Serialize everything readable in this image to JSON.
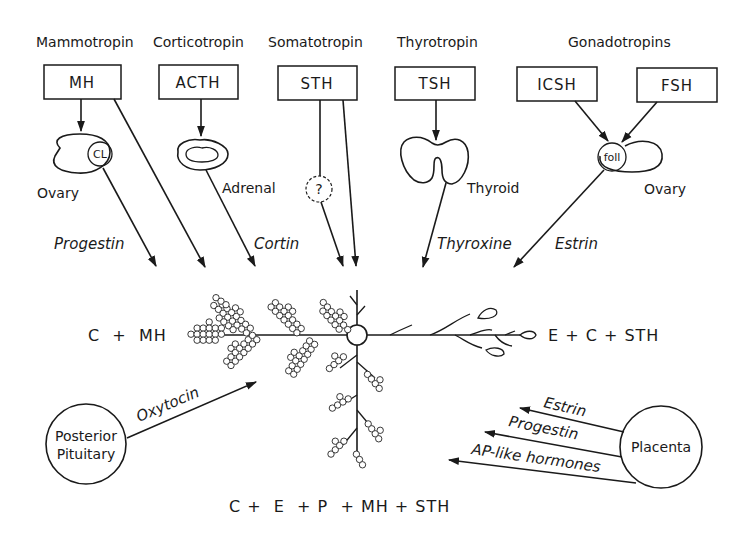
{
  "colors": {
    "ink": "#1a1a1a",
    "background": "#ffffff"
  },
  "tropins": [
    {
      "name": "Mammotropin",
      "abbrev": "MH"
    },
    {
      "name": "Corticotropin",
      "abbrev": "ACTH"
    },
    {
      "name": "Somatotropin",
      "abbrev": "STH"
    },
    {
      "name": "Thyrotropin",
      "abbrev": "TSH"
    },
    {
      "name": "Gonadotropins",
      "abbrevs": [
        "ICSH",
        "FSH"
      ]
    }
  ],
  "target_glands": {
    "ovary_left": {
      "label": "Ovary",
      "inner": "CL"
    },
    "adrenal": {
      "label": "Adrenal"
    },
    "unknown": {
      "label": "?"
    },
    "thyroid": {
      "label": "Thyroid"
    },
    "ovary_right": {
      "label": "Ovary",
      "inner": "foll"
    }
  },
  "secreted_hormones": {
    "progestin": "Progestin",
    "cortin": "Cortin",
    "thyroxine": "Thyroxine",
    "estrin": "Estrin"
  },
  "mammary": {
    "left_formula": "C  +  MH",
    "right_formula": "E + C + STH",
    "bottom_formula": "C +  E  + P  + MH + STH"
  },
  "posterior_pituitary": {
    "label_line1": "Posterior",
    "label_line2": "Pituitary",
    "hormone": "Oxytocin"
  },
  "placenta": {
    "label": "Placenta",
    "hormones": [
      "Estrin",
      "Progestin",
      "AP-like hormones"
    ]
  }
}
